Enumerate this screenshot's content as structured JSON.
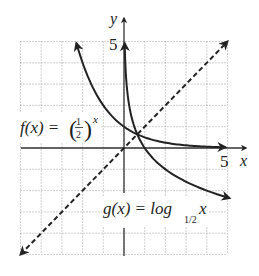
{
  "chart_data": {
    "type": "line",
    "title": "",
    "xlabel": "x",
    "ylabel": "y",
    "xlim": [
      -5,
      5
    ],
    "ylim": [
      -5,
      5
    ],
    "grid": true,
    "grid_style": "dotted",
    "tick_labels": {
      "x": [
        "5"
      ],
      "y": [
        "5"
      ]
    },
    "series": [
      {
        "name": "f(x) = (1/2)^x",
        "label_main": "f(x) = ",
        "label_frac_num": "1",
        "label_frac_den": "2",
        "label_exp": "x",
        "style": "solid",
        "arrows": "both",
        "x": [
          -2.3,
          -2,
          -1.5,
          -1,
          -0.5,
          0,
          0.5,
          1,
          2,
          3,
          4,
          4.9
        ],
        "y": [
          4.92,
          4,
          2.83,
          2,
          1.41,
          1,
          0.71,
          0.5,
          0.25,
          0.125,
          0.0625,
          0.033
        ]
      },
      {
        "name": "g(x) = log_{1/2} x",
        "label_main": "g(x) = log",
        "label_sub": "1/2",
        "label_arg": "x",
        "style": "solid",
        "arrows": "both",
        "x": [
          0.033,
          0.05,
          0.1,
          0.25,
          0.5,
          1,
          2,
          3,
          4,
          5.1
        ],
        "y": [
          4.92,
          4.32,
          3.32,
          2,
          1,
          0,
          -1,
          -1.58,
          -2,
          -2.35
        ]
      },
      {
        "name": "y = x",
        "style": "dashed",
        "arrows": "both",
        "x": [
          -5,
          5
        ],
        "y": [
          -5,
          5
        ]
      }
    ],
    "annotations": [
      {
        "text": "f(x) = (1/2)^x",
        "at": [
          -3.5,
          1.1
        ]
      },
      {
        "text": "g(x) = log_{1/2} x",
        "at": [
          2.3,
          -3.8
        ]
      }
    ]
  },
  "axes": {
    "x_label": "x",
    "y_label": "y",
    "x_tick": "5",
    "y_tick": "5"
  },
  "labels": {
    "f_main": "f(x) = ",
    "f_num": "1",
    "f_den": "2",
    "f_exp": "x",
    "g_main": "g(x) = log",
    "g_sub": "1/2",
    "g_arg": "x"
  }
}
